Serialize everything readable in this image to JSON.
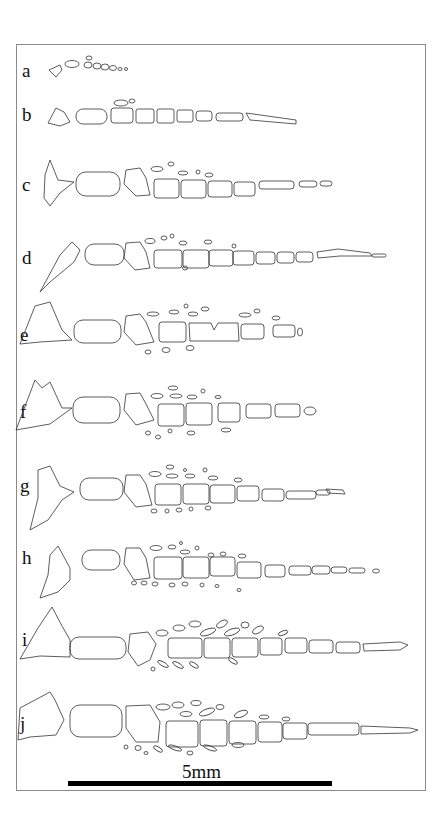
{
  "figure": {
    "panels": [
      {
        "label": "a",
        "top": 61
      },
      {
        "label": "b",
        "top": 107
      },
      {
        "label": "c",
        "top": 177
      },
      {
        "label": "d",
        "top": 250
      },
      {
        "label": "e",
        "top": 327
      },
      {
        "label": "f",
        "top": 403
      },
      {
        "label": "g",
        "top": 478
      },
      {
        "label": "h",
        "top": 550
      },
      {
        "label": "i",
        "top": 628
      },
      {
        "label": "j",
        "top": 715
      }
    ],
    "scale_bar": {
      "label": "5mm"
    }
  }
}
